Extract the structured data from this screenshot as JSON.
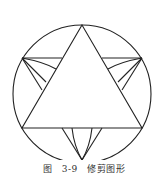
{
  "figure": {
    "caption": "图 3-9   修剪图形"
  }
}
